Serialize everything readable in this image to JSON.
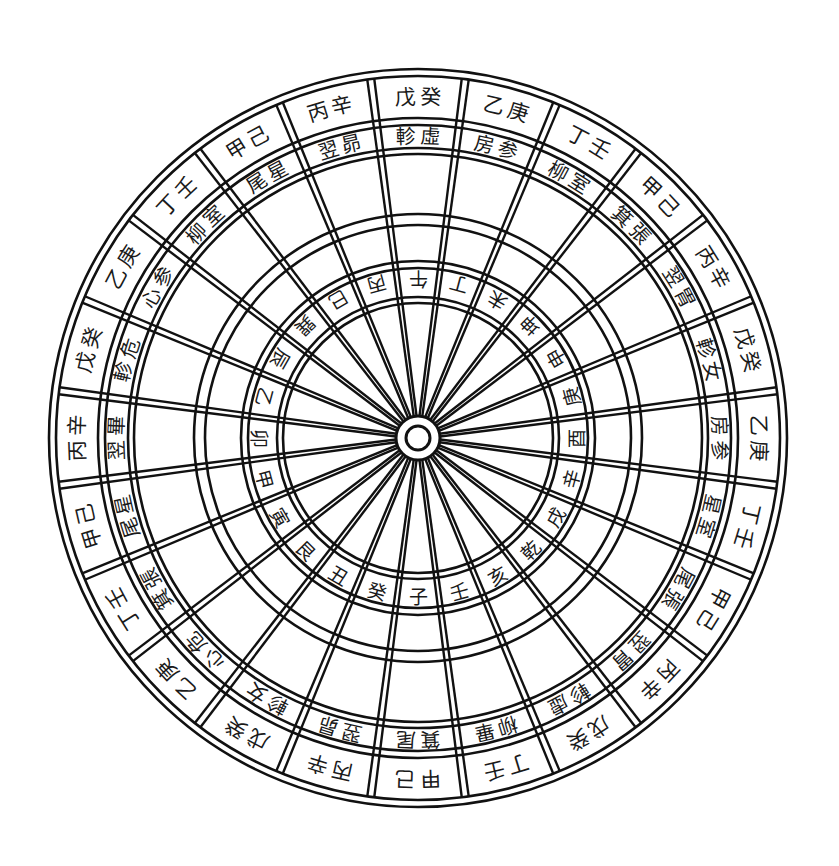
{
  "diagram": {
    "title": "",
    "type": "24-mountain compass dial",
    "center": {
      "x": 418,
      "y": 438
    },
    "colors": {
      "line": "#111111",
      "text": "#1a1a1a",
      "background": "#ffffff"
    },
    "radii": {
      "outer": [
        369,
        362
      ],
      "stem_band": [
        362,
        320
      ],
      "mansion_band": [
        313,
        290
      ],
      "middle_rings": [
        284,
        224,
        213
      ],
      "mountain_band": [
        177,
        141
      ],
      "inner_rings": [
        170,
        135
      ],
      "hub": [
        22,
        12
      ]
    },
    "sector_count": 24,
    "sectors": [
      {
        "angle": 0,
        "stems": "戊癸",
        "mansions": "軫虛",
        "mountain": "午"
      },
      {
        "angle": 15,
        "stems": "乙庚",
        "mansions": "房参",
        "mountain": "丁"
      },
      {
        "angle": 30,
        "stems": "丁壬",
        "mansions": "柳室",
        "mountain": "未"
      },
      {
        "angle": 45,
        "stems": "甲己",
        "mansions": "箕張",
        "mountain": "坤"
      },
      {
        "angle": 60,
        "stems": "丙辛",
        "mansions": "翌胃",
        "mountain": "申"
      },
      {
        "angle": 75,
        "stems": "戊癸",
        "mansions": "軫女",
        "mountain": "庚"
      },
      {
        "angle": 90,
        "stems": "乙庚",
        "mansions": "房参",
        "mountain": "酉"
      },
      {
        "angle": 105,
        "stems": "丁壬",
        "mansions": "星室",
        "mountain": "辛"
      },
      {
        "angle": 120,
        "stems": "甲己",
        "mansions": "尾張",
        "mountain": "戌"
      },
      {
        "angle": 135,
        "stems": "丙辛",
        "mansions": "翌胃",
        "mountain": "乾"
      },
      {
        "angle": 150,
        "stems": "戊癸",
        "mansions": "軫虛",
        "mountain": "亥"
      },
      {
        "angle": 165,
        "stems": "丁壬",
        "mansions": "柳畢",
        "mountain": "壬"
      },
      {
        "angle": 180,
        "stems": "甲己",
        "mansions": "箕尾",
        "mountain": "子"
      },
      {
        "angle": 195,
        "stems": "丙辛",
        "mansions": "翌昴",
        "mountain": "癸"
      },
      {
        "angle": 210,
        "stems": "戊癸",
        "mansions": "軫女",
        "mountain": "丑"
      },
      {
        "angle": 225,
        "stems": "乙庚",
        "mansions": "心危",
        "mountain": "艮"
      },
      {
        "angle": 240,
        "stems": "丁壬",
        "mansions": "箕張",
        "mountain": "寅"
      },
      {
        "angle": 255,
        "stems": "甲己",
        "mansions": "尾星",
        "mountain": "甲"
      },
      {
        "angle": 270,
        "stems": "丙辛",
        "mansions": "翌畢",
        "mountain": "卯"
      },
      {
        "angle": 285,
        "stems": "戊癸",
        "mansions": "軫危",
        "mountain": "乙"
      },
      {
        "angle": 300,
        "stems": "乙庚",
        "mansions": "心参",
        "mountain": "辰"
      },
      {
        "angle": 315,
        "stems": "丁壬",
        "mansions": "柳室",
        "mountain": "巽"
      },
      {
        "angle": 330,
        "stems": "甲己",
        "mansions": "尾星",
        "mountain": "巳"
      },
      {
        "angle": 345,
        "stems": "丙辛",
        "mansions": "翌昴",
        "mountain": "丙"
      }
    ]
  }
}
